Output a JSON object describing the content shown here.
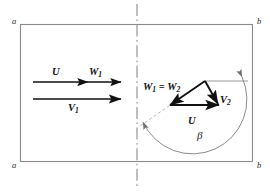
{
  "figure": {
    "type": "velocity-triangle-diagram",
    "background_color": "#ffffff",
    "line_color": "#111111",
    "frame_color": "#8a8a8a",
    "guide_color": "#9a9a9a",
    "frame": {
      "x": 20,
      "y": 24,
      "width": 233,
      "height": 138
    },
    "centerline": {
      "x": 137,
      "style": "dash-dot",
      "top": 4,
      "bottom": 189
    }
  },
  "corner_labels": {
    "top_left": "a",
    "top_right": "b",
    "bottom_left": "a",
    "bottom_right": "b"
  },
  "left_vectors": {
    "upstream_label_u": "U",
    "upstream_label_w1": "W",
    "upstream_label_w1_sub": "1",
    "lower_label_v1": "V",
    "lower_label_v1_sub": "1"
  },
  "right_triangle": {
    "label_w": "W",
    "label_w_sub1": "1",
    "label_w_eq": " = ",
    "label_w2": "W",
    "label_w_sub2": "2",
    "label_v2": "V",
    "label_v2_sub": "2",
    "label_u": "U",
    "label_beta": "β"
  }
}
